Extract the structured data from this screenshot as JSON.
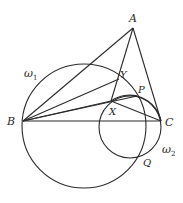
{
  "figure": {
    "type": "geometry-diagram",
    "points": {
      "A": {
        "label": "A",
        "x": 133,
        "y": 28
      },
      "B": {
        "label": "B",
        "x": 23,
        "y": 121
      },
      "C": {
        "label": "C",
        "x": 161,
        "y": 121
      },
      "X": {
        "label": "X",
        "x": 111,
        "y": 101
      },
      "Y": {
        "label": "Y",
        "x": 119,
        "y": 79
      },
      "P": {
        "label": "P",
        "x": 137,
        "y": 96
      },
      "Q": {
        "label": "Q",
        "x": 140,
        "y": 155
      }
    },
    "circles": {
      "omega1": {
        "label": "ω",
        "subscript": "1",
        "cx": 84,
        "cy": 126,
        "r": 62
      },
      "omega2": {
        "label": "ω",
        "subscript": "2",
        "cx": 130,
        "cy": 127,
        "r": 31
      }
    },
    "segments": [
      [
        "A",
        "B"
      ],
      [
        "A",
        "C"
      ],
      [
        "B",
        "C"
      ],
      [
        "A",
        "X"
      ],
      [
        "B",
        "Y"
      ],
      [
        "B",
        "P"
      ],
      [
        "B",
        "X"
      ],
      [
        "X",
        "C"
      ]
    ],
    "stroke_color": "#2a2a2a",
    "background": "#ffffff"
  }
}
